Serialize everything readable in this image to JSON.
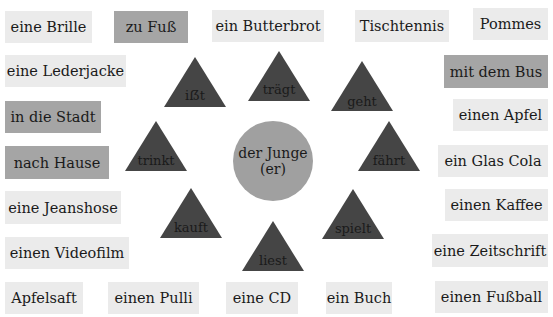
{
  "center": {
    "line1": "der Junge",
    "line2": "(er)",
    "color": "#a0a0a0"
  },
  "verbs": [
    {
      "label": "iẞt"
    },
    {
      "label": "trägt"
    },
    {
      "label": "geht"
    },
    {
      "label": "trinkt"
    },
    {
      "label": "fährt"
    },
    {
      "label": "kauft"
    },
    {
      "label": "liest"
    },
    {
      "label": "spielt"
    }
  ],
  "boxes": [
    {
      "label": "eine Brille",
      "style": "light"
    },
    {
      "label": "zu Fuß",
      "style": "dark"
    },
    {
      "label": "ein Butterbrot",
      "style": "light"
    },
    {
      "label": "Tischtennis",
      "style": "light"
    },
    {
      "label": "Pommes",
      "style": "light"
    },
    {
      "label": "eine Lederjacke",
      "style": "light"
    },
    {
      "label": "mit dem Bus",
      "style": "dark"
    },
    {
      "label": "in die Stadt",
      "style": "dark"
    },
    {
      "label": "einen Apfel",
      "style": "light"
    },
    {
      "label": "nach Hause",
      "style": "dark"
    },
    {
      "label": "ein Glas Cola",
      "style": "light"
    },
    {
      "label": "eine Jeanshose",
      "style": "light"
    },
    {
      "label": "einen Kaffee",
      "style": "light"
    },
    {
      "label": "einen Videofilm",
      "style": "light"
    },
    {
      "label": "eine Zeitschrift",
      "style": "light"
    },
    {
      "label": "Apfelsaft",
      "style": "light"
    },
    {
      "label": "einen Pulli",
      "style": "light"
    },
    {
      "label": "eine CD",
      "style": "light"
    },
    {
      "label": "ein Buch",
      "style": "light"
    },
    {
      "label": "einen Fußball",
      "style": "light"
    }
  ],
  "colors": {
    "light_box": "#ebebeb",
    "dark_box": "#a5a5a5",
    "triangle": "#454545"
  }
}
